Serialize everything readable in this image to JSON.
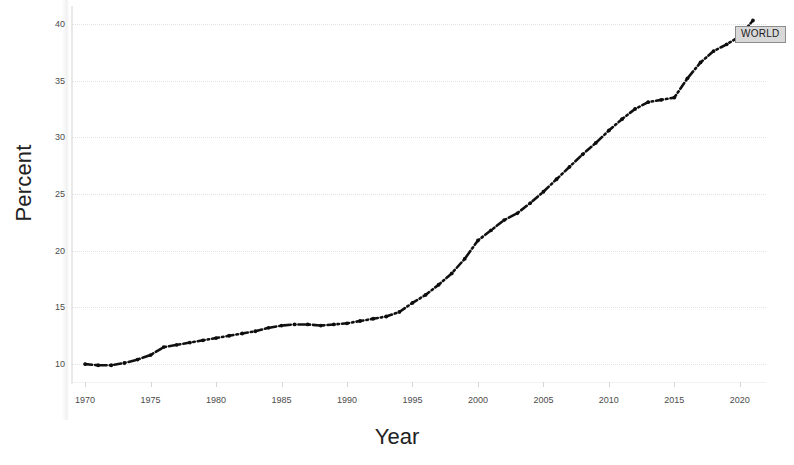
{
  "chart_data": {
    "type": "line",
    "title": "",
    "xlabel": "Year",
    "ylabel": "Percent",
    "xlim": [
      1969,
      2022
    ],
    "ylim": [
      8.6,
      41.4
    ],
    "grid": true,
    "grid_axis": "y",
    "legend_position": "end-of-line",
    "line_style": "dash-dot",
    "line_color": "#111111",
    "x_ticks": [
      1970,
      1975,
      1980,
      1985,
      1990,
      1995,
      2000,
      2005,
      2010,
      2015,
      2020
    ],
    "y_ticks": [
      10,
      15,
      20,
      25,
      30,
      35,
      40
    ],
    "series": [
      {
        "name": "WORLD",
        "label": "WORLD",
        "x": [
          1970,
          1971,
          1972,
          1973,
          1974,
          1975,
          1976,
          1977,
          1978,
          1979,
          1980,
          1981,
          1982,
          1983,
          1984,
          1985,
          1986,
          1987,
          1988,
          1989,
          1990,
          1991,
          1992,
          1993,
          1994,
          1995,
          1996,
          1997,
          1998,
          1999,
          2000,
          2001,
          2002,
          2003,
          2004,
          2005,
          2006,
          2007,
          2008,
          2009,
          2010,
          2011,
          2012,
          2013,
          2014,
          2015,
          2016,
          2017,
          2018,
          2019,
          2020,
          2021
        ],
        "values": [
          10.0,
          9.9,
          9.9,
          10.1,
          10.4,
          10.8,
          11.5,
          11.7,
          11.9,
          12.1,
          12.3,
          12.5,
          12.7,
          12.9,
          13.2,
          13.4,
          13.5,
          13.5,
          13.4,
          13.5,
          13.6,
          13.8,
          14.0,
          14.2,
          14.6,
          15.4,
          16.1,
          17.0,
          18.0,
          19.3,
          20.9,
          21.8,
          22.7,
          23.3,
          24.2,
          25.2,
          26.3,
          27.4,
          28.5,
          29.5,
          30.6,
          31.6,
          32.5,
          33.1,
          33.3,
          33.5,
          35.2,
          36.6,
          37.6,
          38.2,
          38.9,
          40.3
        ]
      }
    ]
  },
  "axes": {
    "y_title": "Percent",
    "x_title": "Year"
  }
}
